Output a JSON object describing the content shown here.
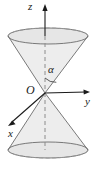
{
  "figure": {
    "kind": "double-cone-3d-diagram",
    "background_color": "#ffffff",
    "stroke_color": "#6b6b6b",
    "axis_color": "#1a1a1a",
    "surface_fill": "#ededed",
    "top_ellipse_fill": "#e4e4e4",
    "bottom_ellipse_fill": "#e4e4e4",
    "dash_color": "#8c8c8c"
  },
  "labels": {
    "z_axis": "z",
    "y_axis": "y",
    "x_axis": "x",
    "origin": "O",
    "half_angle": "α"
  },
  "geometry": {
    "apex": {
      "x": 45,
      "y": 93
    },
    "top_ellipse": {
      "cx": 48,
      "cy": 36,
      "rx": 40,
      "ry": 8
    },
    "bottom_ellipse": {
      "cx": 48,
      "cy": 150,
      "rx": 40,
      "ry": 8
    },
    "z_axis_tip": {
      "x": 45,
      "y": 5
    },
    "y_axis_tip": {
      "x": 89,
      "y": 92
    },
    "x_axis_tip": {
      "x": 8,
      "y": 124
    },
    "angle_arc_radius": 14
  }
}
